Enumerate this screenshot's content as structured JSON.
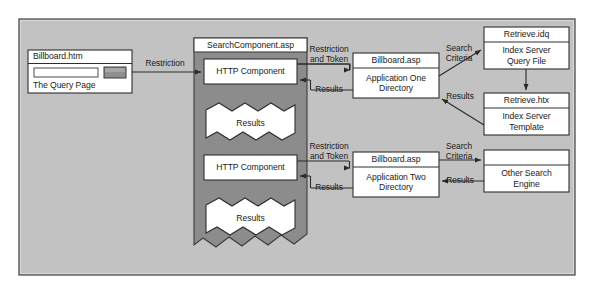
{
  "diagram": {
    "panel": {
      "background_color": "#c2c2c2",
      "border_color": "#4a4a4a"
    },
    "container": {
      "name": "SearchComponent.asp",
      "label": "SearchComponent.asp",
      "fill_color": "#8c8c8c",
      "header_fill": "#ffffff"
    },
    "nodes": [
      {
        "id": "billboard-htm",
        "title": "Billboard.htm",
        "body": "The Query Page",
        "has_form": true,
        "input_value": "",
        "button_label": ""
      },
      {
        "id": "http-component-one",
        "title": "HTTP Component",
        "body": ""
      },
      {
        "id": "results-one",
        "title": "Results",
        "body": "",
        "shape": "torn-paper"
      },
      {
        "id": "http-component-two",
        "title": "HTTP Component",
        "body": ""
      },
      {
        "id": "results-two",
        "title": "Results",
        "body": "",
        "shape": "torn-paper"
      },
      {
        "id": "billboard-asp-one",
        "title": "Billboard.asp",
        "body": "Application One\nDirectory"
      },
      {
        "id": "billboard-asp-two",
        "title": "Billboard.asp",
        "body": "Application Two\nDirectory"
      },
      {
        "id": "retrieve-idq",
        "title": "Retrieve.idq",
        "body": "Index Server\nQuery File"
      },
      {
        "id": "retrieve-htx",
        "title": "Retrieve.htx",
        "body": "Index Server\nTemplate"
      },
      {
        "id": "other-search-engine",
        "title": "",
        "body": "Other Search\nEngine"
      }
    ],
    "edges": [
      {
        "id": "edge-restriction",
        "label": "Restriction"
      },
      {
        "id": "edge-restriction-token-one",
        "label": "Restriction\nand Token"
      },
      {
        "id": "edge-results-one",
        "label": "Results"
      },
      {
        "id": "edge-search-criteria-one",
        "label": "Search\nCriteria"
      },
      {
        "id": "edge-results-idq",
        "label": "Results"
      },
      {
        "id": "edge-restriction-token-two",
        "label": "Restriction\nand Token"
      },
      {
        "id": "edge-results-two",
        "label": "Results"
      },
      {
        "id": "edge-search-criteria-two",
        "label": "Search\nCriteria"
      },
      {
        "id": "edge-results-other",
        "label": "Results"
      }
    ]
  }
}
